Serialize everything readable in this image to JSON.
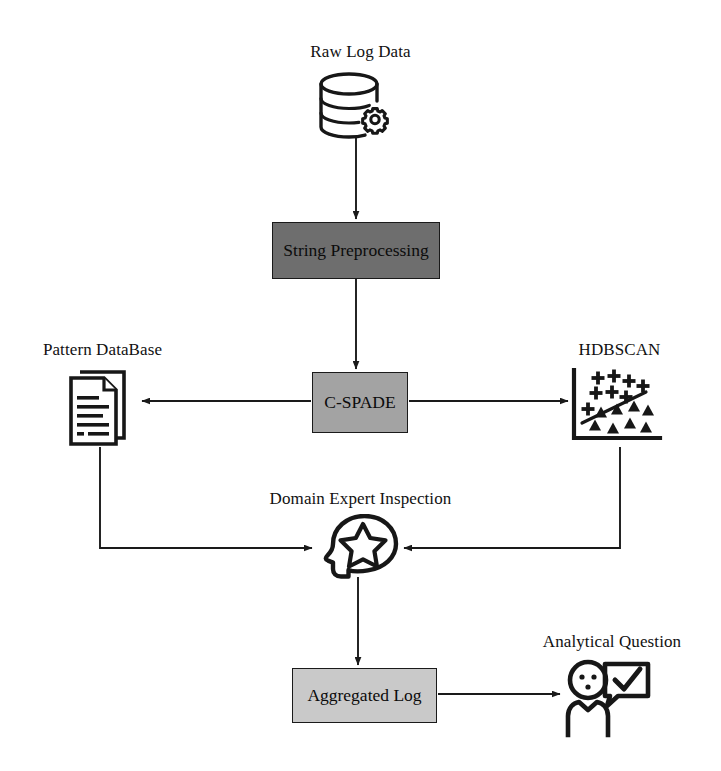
{
  "diagram": {
    "type": "flowchart",
    "background_color": "#ffffff",
    "stroke_color": "#1a1a1a"
  },
  "nodes": {
    "raw_log_data": {
      "label": "Raw Log Data",
      "icon": "database-gear-icon",
      "shape": "icon",
      "fill": "none"
    },
    "string_preprocessing": {
      "label": "String Preprocessing",
      "shape": "rectangle",
      "fill": "#6e6e6e"
    },
    "pattern_database": {
      "label": "Pattern DataBase",
      "icon": "document-stack-icon",
      "shape": "icon",
      "fill": "none"
    },
    "cspade": {
      "label": "C-SPADE",
      "shape": "rectangle",
      "fill": "#a3a3a3"
    },
    "hdbscan": {
      "label": "HDBSCAN",
      "icon": "scatter-plot-icon",
      "shape": "icon",
      "fill": "none"
    },
    "domain_expert_inspection": {
      "label": "Domain Expert Inspection",
      "icon": "head-star-icon",
      "shape": "icon",
      "fill": "none"
    },
    "aggregated_log": {
      "label": "Aggregated Log",
      "shape": "rectangle",
      "fill": "#c9c9c9"
    },
    "analytical_question": {
      "label": "Analytical Question",
      "icon": "person-check-bubble-icon",
      "shape": "icon",
      "fill": "none"
    }
  },
  "edges": [
    {
      "from": "raw_log_data",
      "to": "string_preprocessing",
      "arrow": "single",
      "style": "straight-vertical"
    },
    {
      "from": "string_preprocessing",
      "to": "cspade",
      "arrow": "single",
      "style": "straight-vertical"
    },
    {
      "from": "cspade",
      "to": "pattern_database",
      "arrow": "single",
      "style": "straight-horizontal-left"
    },
    {
      "from": "cspade",
      "to": "hdbscan",
      "arrow": "single",
      "style": "straight-horizontal-right"
    },
    {
      "from": "pattern_database",
      "to": "domain_expert_inspection",
      "arrow": "single",
      "style": "elbow-down-right"
    },
    {
      "from": "hdbscan",
      "to": "domain_expert_inspection",
      "arrow": "single",
      "style": "elbow-down-left"
    },
    {
      "from": "domain_expert_inspection",
      "to": "aggregated_log",
      "arrow": "single",
      "style": "straight-vertical"
    },
    {
      "from": "aggregated_log",
      "to": "analytical_question",
      "arrow": "single",
      "style": "straight-horizontal-right"
    }
  ]
}
